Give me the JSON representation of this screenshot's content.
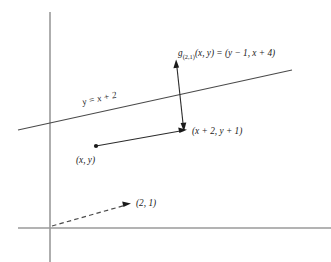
{
  "figure": {
    "background_color": "#ffffff",
    "axis_color": "#9a9a9a",
    "ink_color": "#1a1a1a",
    "labels": {
      "function_name": "g",
      "function_subscript": "(2,1)",
      "function_args": "(x, y) = (y − 1, x + 4)",
      "function_full": "g(2,1)(x, y) = (y − 1, x + 4)",
      "line_equation": "y = x + 2",
      "translated_point": "(x + 2, y + 1)",
      "source_point": "(x, y)",
      "translation_vector": "(2, 1)"
    },
    "geometry": {
      "origin": {
        "x": 50,
        "y": 228
      },
      "y_axis": {
        "x": 50,
        "y_top": 12,
        "y_bottom": 262
      },
      "x_axis": {
        "y": 228,
        "x_left": 18,
        "x_right": 331
      },
      "slanted_line": {
        "x1": 18,
        "y1": 130,
        "x2": 292,
        "y2": 70
      },
      "source_dot": {
        "x": 96,
        "y": 146
      },
      "translation_arrow": {
        "x1": 96,
        "y1": 146,
        "x2": 186,
        "y2": 130
      },
      "reflection_arrow": {
        "x1": 183,
        "y1": 130,
        "x2": 176,
        "y2": 61
      },
      "dashed_arrow": {
        "x1": 52,
        "y1": 226,
        "x2": 130,
        "y2": 204
      }
    }
  }
}
